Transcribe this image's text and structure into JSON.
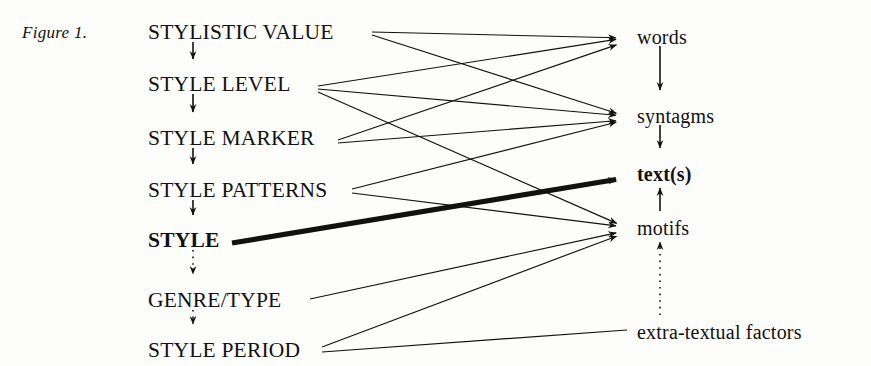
{
  "figure": {
    "caption": "Figure 1.",
    "background_color": "#fdfdfb",
    "ink_color": "#111111"
  },
  "left_column": {
    "label": "stylistic hierarchy",
    "items": [
      {
        "id": "stylistic-value",
        "label": "STYLISTIC VALUE",
        "bold": false,
        "x": 148,
        "y": 22
      },
      {
        "id": "style-level",
        "label": "STYLE LEVEL",
        "bold": false,
        "x": 148,
        "y": 74
      },
      {
        "id": "style-marker",
        "label": "STYLE MARKER",
        "bold": false,
        "x": 148,
        "y": 128
      },
      {
        "id": "style-patterns",
        "label": "STYLE PATTERNS",
        "bold": false,
        "x": 148,
        "y": 180
      },
      {
        "id": "style",
        "label": "STYLE",
        "bold": true,
        "x": 148,
        "y": 230
      },
      {
        "id": "genre-type",
        "label": "GENRE/TYPE",
        "bold": false,
        "x": 148,
        "y": 290
      },
      {
        "id": "style-period",
        "label": "STYLE PERIOD",
        "bold": false,
        "x": 148,
        "y": 340
      }
    ]
  },
  "right_column": {
    "label": "textual units",
    "items": [
      {
        "id": "words",
        "label": "words",
        "bold": false,
        "x": 637,
        "y": 27
      },
      {
        "id": "syntagms",
        "label": "syntagms",
        "bold": false,
        "x": 637,
        "y": 106
      },
      {
        "id": "texts",
        "label": "text(s)",
        "bold": true,
        "x": 637,
        "y": 164
      },
      {
        "id": "motifs",
        "label": "motifs",
        "bold": false,
        "x": 637,
        "y": 218
      },
      {
        "id": "extra-textual-factors",
        "label": "extra-textual factors",
        "bold": false,
        "x": 637,
        "y": 322
      }
    ]
  },
  "vertical_arrows": {
    "left": [
      {
        "id": "arrow-stylistic-value-to-style-level",
        "from": "stylistic-value",
        "to": "style-level",
        "style": "solid",
        "x": 193,
        "y1": 42,
        "y2": 68
      },
      {
        "id": "arrow-style-level-to-style-marker",
        "from": "style-level",
        "to": "style-marker",
        "style": "solid",
        "x": 193,
        "y1": 94,
        "y2": 121
      },
      {
        "id": "arrow-style-marker-to-style-patterns",
        "from": "style-marker",
        "to": "style-patterns",
        "style": "solid",
        "x": 193,
        "y1": 148,
        "y2": 173
      },
      {
        "id": "arrow-style-patterns-to-style",
        "from": "style-patterns",
        "to": "style",
        "style": "solid",
        "x": 193,
        "y1": 200,
        "y2": 224
      },
      {
        "id": "arrow-style-to-genre-type",
        "from": "style",
        "to": "genre-type",
        "style": "dotted",
        "x": 193,
        "y1": 250,
        "y2": 283
      },
      {
        "id": "arrow-genre-type-to-style-period",
        "from": "genre-type",
        "to": "style-period",
        "style": "dotted",
        "x": 193,
        "y1": 310,
        "y2": 333
      }
    ],
    "right": [
      {
        "id": "arrow-words-to-syntagms",
        "from": "words",
        "to": "syntagms",
        "style": "solid",
        "direction": "down",
        "x": 660,
        "y1": 46,
        "y2": 99
      },
      {
        "id": "arrow-syntagms-to-texts",
        "from": "syntagms",
        "to": "texts",
        "style": "solid",
        "direction": "down",
        "x": 660,
        "y1": 125,
        "y2": 157
      },
      {
        "id": "arrow-motifs-to-texts",
        "from": "motifs",
        "to": "texts",
        "style": "solid",
        "direction": "up",
        "x": 660,
        "y1": 211,
        "y2": 179
      },
      {
        "id": "arrow-extra-factors-to-motifs",
        "from": "extra-textual-factors",
        "to": "motifs",
        "style": "dotted",
        "direction": "up",
        "x": 660,
        "y1": 315,
        "y2": 233
      }
    ]
  },
  "cross_links": [
    {
      "id": "link-stylistic-value-words",
      "from": "stylistic-value",
      "to": "words",
      "weight": "thin",
      "x1": 372,
      "y1": 32,
      "x2": 625,
      "y2": 38
    },
    {
      "id": "link-stylistic-value-syntagms",
      "from": "stylistic-value",
      "to": "syntagms",
      "weight": "thin",
      "x1": 372,
      "y1": 35,
      "x2": 625,
      "y2": 116
    },
    {
      "id": "link-style-level-words",
      "from": "style-level",
      "to": "words",
      "weight": "thin",
      "x1": 318,
      "y1": 86,
      "x2": 625,
      "y2": 38
    },
    {
      "id": "link-style-level-syntagms",
      "from": "style-level",
      "to": "syntagms",
      "weight": "thin",
      "x1": 318,
      "y1": 89,
      "x2": 625,
      "y2": 116
    },
    {
      "id": "link-style-level-motifs",
      "from": "style-level",
      "to": "motifs",
      "weight": "thin",
      "x1": 318,
      "y1": 92,
      "x2": 625,
      "y2": 227
    },
    {
      "id": "link-style-marker-words",
      "from": "style-marker",
      "to": "words",
      "weight": "thin",
      "x1": 338,
      "y1": 140,
      "x2": 625,
      "y2": 42
    },
    {
      "id": "link-style-marker-syntagms",
      "from": "style-marker",
      "to": "syntagms",
      "weight": "thin",
      "x1": 338,
      "y1": 143,
      "x2": 625,
      "y2": 120
    },
    {
      "id": "link-style-patterns-syntagms",
      "from": "style-patterns",
      "to": "syntagms",
      "weight": "thin",
      "x1": 352,
      "y1": 189,
      "x2": 625,
      "y2": 120
    },
    {
      "id": "link-style-patterns-motifs",
      "from": "style-patterns",
      "to": "motifs",
      "weight": "thin",
      "x1": 352,
      "y1": 193,
      "x2": 625,
      "y2": 227
    },
    {
      "id": "link-style-texts",
      "from": "style",
      "to": "texts",
      "weight": "thick",
      "x1": 232,
      "y1": 243,
      "x2": 625,
      "y2": 178
    },
    {
      "id": "link-genre-type-motifs",
      "from": "genre-type",
      "to": "motifs",
      "weight": "thin",
      "x1": 310,
      "y1": 299,
      "x2": 625,
      "y2": 231
    },
    {
      "id": "link-style-period-motifs",
      "from": "style-period",
      "to": "motifs",
      "weight": "thin",
      "x1": 322,
      "y1": 347,
      "x2": 625,
      "y2": 233
    },
    {
      "id": "link-style-period-extra",
      "from": "style-period",
      "to": "extra-textual-factors",
      "weight": "thin",
      "x1": 322,
      "y1": 352,
      "x2": 627,
      "y2": 330
    }
  ]
}
